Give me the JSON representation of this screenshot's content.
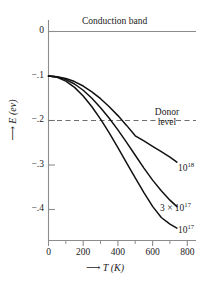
{
  "chart_data": {
    "type": "line",
    "title": "",
    "xlabel": "T (K)",
    "ylabel": "E (ev)",
    "xlabel_arrow": "⟶",
    "ylabel_arrow": "⟶",
    "xlim": [
      0,
      850
    ],
    "ylim": [
      -0.46,
      0.035
    ],
    "grid": false,
    "legend_position": "inline-right-of-curve-ends",
    "xticks": [
      0,
      200,
      400,
      600,
      800
    ],
    "xtick_labels": [
      "0",
      "200",
      "400",
      "600",
      "800"
    ],
    "xminor_ticks": [
      100,
      300,
      500,
      700
    ],
    "yticks": [
      0,
      -0.1,
      -0.2,
      -0.3,
      -0.4
    ],
    "ytick_labels": [
      "0",
      "−.1",
      "−.2",
      "−.3",
      "−.4"
    ],
    "annotations": [
      {
        "name": "conduction-band",
        "text": "Conduction band",
        "y": 0,
        "type": "solid-line-label"
      },
      {
        "name": "donor-level",
        "text": "Donor level",
        "text_line1": "Donor",
        "text_line2": "level",
        "y": -0.2,
        "type": "dashed-line-label"
      }
    ],
    "series": [
      {
        "name": "1e18",
        "label": "10",
        "label_exponent": "18",
        "points": [
          [
            0,
            -0.1
          ],
          [
            50,
            -0.1015
          ],
          [
            100,
            -0.1055
          ],
          [
            150,
            -0.1125
          ],
          [
            200,
            -0.1225
          ],
          [
            250,
            -0.1355
          ],
          [
            300,
            -0.151
          ],
          [
            350,
            -0.169
          ],
          [
            400,
            -0.189
          ],
          [
            450,
            -0.211
          ],
          [
            500,
            -0.2345
          ],
          [
            550,
            -0.246
          ],
          [
            600,
            -0.258
          ],
          [
            650,
            -0.27
          ],
          [
            700,
            -0.2825
          ],
          [
            740,
            -0.2935
          ]
        ]
      },
      {
        "name": "3e17",
        "label": "3 × 10",
        "label_exponent": "17",
        "points": [
          [
            0,
            -0.1
          ],
          [
            50,
            -0.1022
          ],
          [
            100,
            -0.1082
          ],
          [
            150,
            -0.118
          ],
          [
            200,
            -0.132
          ],
          [
            250,
            -0.15
          ],
          [
            300,
            -0.1712
          ],
          [
            350,
            -0.195
          ],
          [
            400,
            -0.221
          ],
          [
            450,
            -0.249
          ],
          [
            500,
            -0.278
          ],
          [
            550,
            -0.307
          ],
          [
            600,
            -0.334
          ],
          [
            650,
            -0.358
          ],
          [
            700,
            -0.379
          ],
          [
            740,
            -0.3935
          ]
        ]
      },
      {
        "name": "1e17",
        "label": "10",
        "label_exponent": "17",
        "points": [
          [
            0,
            -0.1
          ],
          [
            50,
            -0.103
          ],
          [
            100,
            -0.1115
          ],
          [
            150,
            -0.1255
          ],
          [
            200,
            -0.145
          ],
          [
            250,
            -0.169
          ],
          [
            300,
            -0.197
          ],
          [
            350,
            -0.228
          ],
          [
            400,
            -0.261
          ],
          [
            450,
            -0.295
          ],
          [
            500,
            -0.329
          ],
          [
            550,
            -0.362
          ],
          [
            600,
            -0.393
          ],
          [
            650,
            -0.418
          ],
          [
            700,
            -0.433
          ],
          [
            740,
            -0.442
          ]
        ]
      }
    ],
    "crossings_donor_level": [
      {
        "series": "1e17",
        "T": 310
      },
      {
        "series": "3e17",
        "T": 372
      },
      {
        "series": "1e18",
        "T": 486
      }
    ],
    "colors": {
      "curve": "#111111",
      "axis": "#8c8c8c",
      "band_line": "#8c8c8c",
      "donor_line": "#6e6e6e",
      "text": "#1a1a1a",
      "background": "#ffffff"
    }
  }
}
